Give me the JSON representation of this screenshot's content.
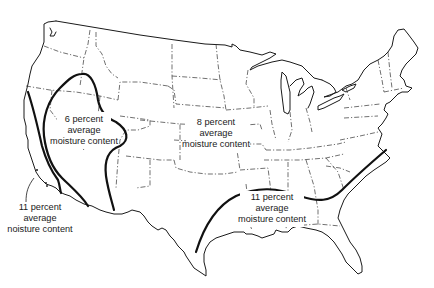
{
  "figure": {
    "colors": {
      "background": "#ffffff",
      "ink": "#1a1a1a",
      "zone_boundary": "#111111"
    }
  },
  "regions": [
    {
      "id": "west-interior",
      "lines": [
        "6 percent",
        "average",
        "moisture content"
      ],
      "value_percent": 6
    },
    {
      "id": "central-north",
      "lines": [
        "8 percent",
        "average",
        "moisture content"
      ],
      "value_percent": 8
    },
    {
      "id": "pacific-coast",
      "lines": [
        "11 percent",
        "average",
        "noisture content"
      ],
      "value_percent": 11
    },
    {
      "id": "southeast",
      "lines": [
        "11 percent",
        "average",
        "moisture content"
      ],
      "value_percent": 11
    }
  ]
}
